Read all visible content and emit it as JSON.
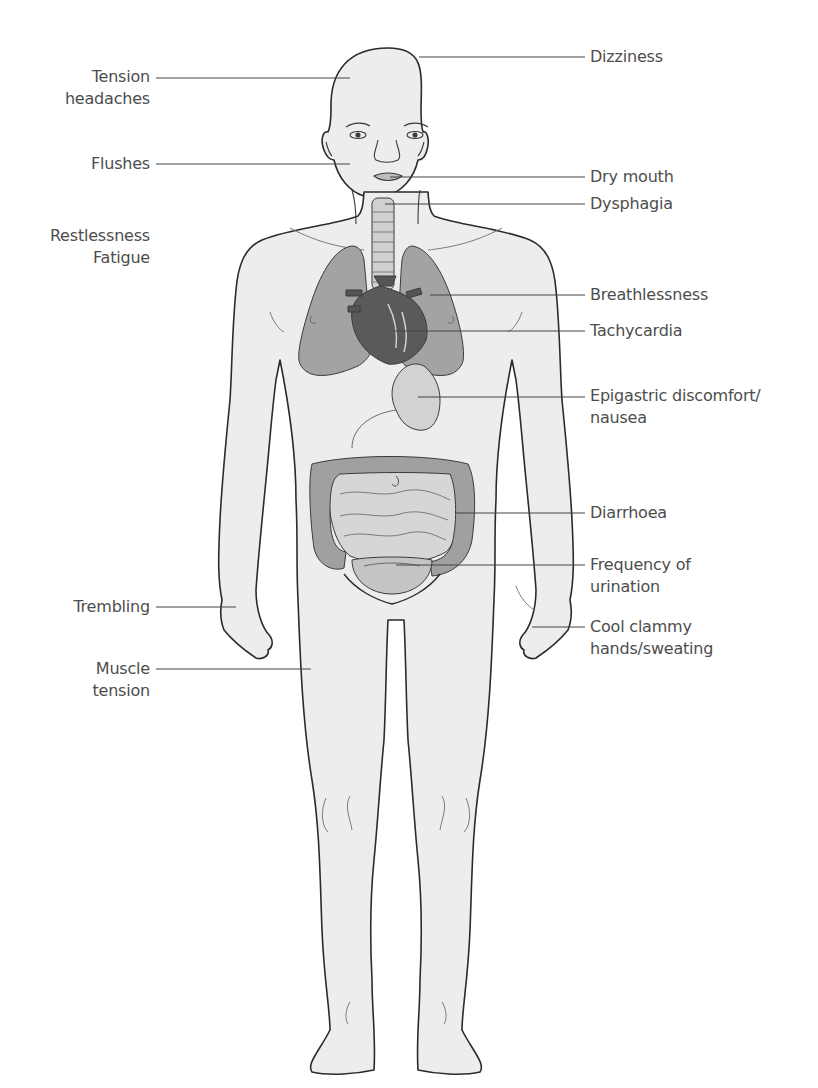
{
  "diagram": {
    "type": "anatomical-symptom-map",
    "colors": {
      "background": "#ffffff",
      "body_fill": "#ededed",
      "outline": "#2b2b2b",
      "organ_fill": "#9a9a9a",
      "organ_dark": "#555555",
      "light_organ": "#d4d4d4",
      "leader_line": "#444444",
      "text": "#4d4d4d"
    },
    "labels_left": [
      {
        "id": "tension-headaches",
        "lines": [
          "Tension",
          "headaches"
        ],
        "x": 150,
        "y": 152,
        "line_y": 164,
        "target_x": 350
      },
      {
        "id": "flushes",
        "lines": [
          "Flushes"
        ],
        "x": 150,
        "y": 155,
        "line_y": 164,
        "target_x": 350
      },
      {
        "id": "restlessness-fatigue",
        "lines": [
          "Restlessness",
          "Fatigue"
        ],
        "x": 150,
        "y": 225,
        "line_y": null,
        "target_x": null
      },
      {
        "id": "trembling",
        "lines": [
          "Trembling"
        ],
        "x": 150,
        "y": 596,
        "line_y": 607,
        "target_x": 236
      },
      {
        "id": "muscle-tension",
        "lines": [
          "Muscle",
          "tension"
        ],
        "x": 150,
        "y": 658,
        "line_y": 669,
        "target_x": 311
      }
    ],
    "labels_right": [
      {
        "id": "dizziness",
        "lines": [
          "Dizziness"
        ],
        "x": 590,
        "y": 48,
        "line_y": 57,
        "target_x": 419
      },
      {
        "id": "dry-mouth",
        "lines": [
          "Dry mouth"
        ],
        "x": 590,
        "y": 168,
        "line_y": 177,
        "target_x": 390
      },
      {
        "id": "dysphagia",
        "lines": [
          "Dysphagia"
        ],
        "x": 590,
        "y": 193,
        "line_y": 204,
        "target_x": 385
      },
      {
        "id": "breathlessness",
        "lines": [
          "Breathlessness"
        ],
        "x": 590,
        "y": 286,
        "line_y": 295,
        "target_x": 430
      },
      {
        "id": "tachycardia",
        "lines": [
          "Tachycardia"
        ],
        "x": 590,
        "y": 321,
        "line_y": 331,
        "target_x": 395
      },
      {
        "id": "epigastric-discomfort",
        "lines": [
          "Epigastric discomfort/",
          "nausea"
        ],
        "x": 590,
        "y": 385,
        "line_y": 397,
        "target_x": 418
      },
      {
        "id": "diarrhoea",
        "lines": [
          "Diarrhoea"
        ],
        "x": 590,
        "y": 504,
        "line_y": 513,
        "target_x": 456
      },
      {
        "id": "frequency-of-urination",
        "lines": [
          "Frequency of",
          "urination"
        ],
        "x": 590,
        "y": 555,
        "line_y": 565,
        "target_x": 396
      },
      {
        "id": "cool-clammy-hands",
        "lines": [
          "Cool clammy",
          "hands/sweating"
        ],
        "x": 590,
        "y": 617,
        "line_y": 627,
        "target_x": 532
      }
    ]
  }
}
